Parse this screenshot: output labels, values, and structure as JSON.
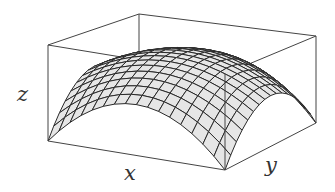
{
  "figure": {
    "type": "3d-surface-plot",
    "colors": {
      "background": "#ffffff",
      "box_edge": "#444444",
      "surface_fill": "#e6e6e6",
      "grid_line": "#2a2a2a",
      "label": "#333333"
    },
    "grid_divisions": 16,
    "axes": {
      "x": {
        "label": "x",
        "pos": [
          124,
          163
        ]
      },
      "y": {
        "label": "y",
        "pos": [
          265,
          155
        ]
      },
      "z": {
        "label": "z",
        "pos": [
          17,
          84
        ]
      }
    },
    "box_corners_px": {
      "bottom_front_left": [
        48,
        141
      ],
      "bottom_front_right": [
        225,
        170
      ],
      "bottom_back_right": [
        316,
        123
      ],
      "bottom_back_left": [
        139,
        94
      ],
      "top_front_left": [
        48,
        45
      ],
      "top_front_right": [
        225,
        74
      ],
      "top_back_right": [
        316,
        36
      ],
      "top_back_left": [
        139,
        14
      ]
    }
  },
  "chart_data": {
    "type": "surface",
    "title": "",
    "xlabel": "x",
    "ylabel": "y",
    "zlabel": "z",
    "domain": {
      "x": [
        -1,
        1
      ],
      "y": [
        -1,
        1
      ]
    },
    "function": "z = 0.81 - 0.28x^2 - 0.28y^2 - 0.25x^2y^2 (normalized; 0 at domain corners, max at center)",
    "z_range": [
      0,
      1
    ],
    "grid": "16 x 16 mesh",
    "box": true,
    "ticks": false
  }
}
